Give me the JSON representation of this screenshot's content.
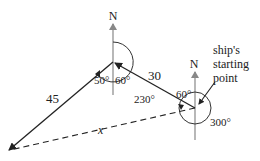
{
  "diagram": {
    "type": "bearing-navigation",
    "north_labels": [
      "N",
      "N"
    ],
    "legs": [
      {
        "label": "30",
        "from": "ship's starting point",
        "bearing": "300°"
      },
      {
        "label": "45",
        "from": "middle point",
        "bearing": "230°"
      }
    ],
    "unknown_side": "x",
    "angles": {
      "middle_left": "50°",
      "middle_right": "60°",
      "middle_bearing": "230°",
      "start_inner": "60°",
      "start_bearing": "300°"
    },
    "annotation": {
      "line1": "ship's",
      "line2": "starting",
      "line3": "point"
    },
    "colors": {
      "solid_line": "#222222",
      "north_line": "#888888",
      "text": "#222222"
    }
  }
}
